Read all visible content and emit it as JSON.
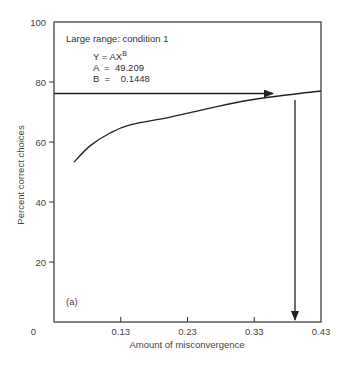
{
  "chart_data": {
    "type": "line",
    "title": "Large range: condition 1",
    "panel_label": "(a)",
    "xlabel": "Amount of misconvergence",
    "ylabel": "Percent correct choices",
    "xlim": [
      0.03,
      0.43
    ],
    "ylim": [
      0,
      100
    ],
    "x_ticks": [
      0.13,
      0.23,
      0.33,
      0.43
    ],
    "x_tick_labels": [
      "0",
      "0.13",
      "0.23",
      "0.33",
      "0.43"
    ],
    "y_ticks": [
      0,
      20,
      40,
      60,
      80,
      100
    ],
    "y_tick_labels": [
      "0",
      "20",
      "40",
      "60",
      "80",
      "100"
    ],
    "grid": false,
    "equation": {
      "formula_line": "Y  =  AX",
      "formula_superscript": "B",
      "a_line": "A  =  49.209",
      "b_line": "B  =    0.1448"
    },
    "series": [
      {
        "name": "Fitted power function",
        "x": [
          0.06,
          0.084,
          0.114,
          0.144,
          0.204,
          0.264,
          0.324,
          0.391,
          0.43
        ],
        "y": [
          53.3,
          58.7,
          63.0,
          65.7,
          68.3,
          71.3,
          74.0,
          76.0,
          77.0
        ]
      }
    ],
    "annotations": [
      {
        "type": "horizontal-arrow",
        "y": 75.5,
        "x_from": 0.03,
        "x_to": 0.36,
        "description": "Threshold at ~75% correct"
      },
      {
        "type": "vertical-arrow",
        "x": 0.391,
        "y_from": 74,
        "y_to": 0,
        "description": "Read down to misconvergence value"
      }
    ]
  }
}
